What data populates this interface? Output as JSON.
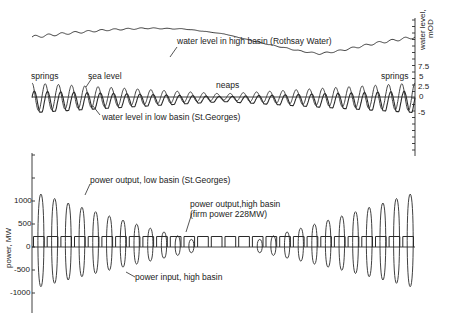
{
  "chart_data": [
    {
      "type": "line",
      "title": "",
      "panel": "top",
      "ylabel": "water level, mOD",
      "ylabel_line1": "water level,",
      "ylabel_line2": "mOD",
      "axis_position": "right",
      "yticks": [
        "7.5",
        "5",
        "2.5",
        "0",
        "-5"
      ],
      "ylim": [
        -15,
        20
      ],
      "xlabel": "",
      "annotations": {
        "high_basin": "water level in high basin (Rothsay Water)",
        "springs_left": "springs",
        "sea_level": "sea level",
        "neaps": "neaps",
        "springs_right": "springs",
        "low_basin": "water level in low basin (St.Georges)"
      },
      "series": [
        {
          "name": "water level in high basin (Rothsay Water)",
          "x_frac": [
            0,
            0.1,
            0.2,
            0.3,
            0.4,
            0.5,
            0.6,
            0.7,
            0.75,
            0.8,
            0.9,
            1.0
          ],
          "values": [
            8.0,
            9.0,
            9.8,
            10.2,
            10.0,
            8.8,
            6.5,
            4.5,
            3.8,
            4.5,
            6.5,
            8.0
          ]
        },
        {
          "name": "sea level",
          "cycles": 29,
          "amplitude_springs": 3.5,
          "amplitude_neaps": 0.8,
          "mean": 0
        },
        {
          "name": "water level in low basin (St.Georges)",
          "cycles": 29,
          "amplitude_springs": 3.0,
          "amplitude_neaps": 0.7,
          "mean": -1.5
        }
      ]
    },
    {
      "type": "line",
      "title": "",
      "panel": "bottom",
      "ylabel": "power, MW",
      "axis_position": "left",
      "yticks": [
        "1000",
        "500",
        "0",
        "-500",
        "-1000"
      ],
      "ylim": [
        -1500,
        2000
      ],
      "xlabel": "",
      "annotations": {
        "low_basin_output": "power output, low basin (St.Georges)",
        "high_basin_output_line1": "power output,high basin",
        "high_basin_output_line2": "(firm power 228MW)",
        "high_basin_input": "power input, high basin"
      },
      "series": [
        {
          "name": "power output, low basin (St.Georges)",
          "cycles": 28,
          "peak_springs": 1200,
          "peak_neaps": 0
        },
        {
          "name": "power input, high basin",
          "cycles": 28,
          "trough_springs": -900,
          "trough_neaps": 0
        },
        {
          "name": "power output, high basin (firm power 228MW)",
          "constant": 228
        }
      ]
    }
  ],
  "colors": {
    "line": "#2a2a2a",
    "background": "#ffffff"
  }
}
